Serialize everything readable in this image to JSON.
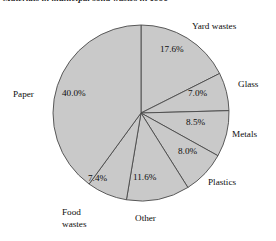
{
  "chart_data": {
    "type": "pie",
    "title": "Materials in municipal solid wastes in 1990",
    "xlabel": "",
    "ylabel": "",
    "legend": "none",
    "grid": false,
    "categories": [
      "Yard wastes",
      "Glass",
      "Metals",
      "Plastics",
      "Other",
      "Food wastes",
      "Paper"
    ],
    "values": [
      17.6,
      7.0,
      8.5,
      8.0,
      11.6,
      7.4,
      40.0
    ],
    "value_labels": [
      "17.6%",
      "7.0%",
      "8.5%",
      "8.0%",
      "11.6%",
      "7.4%",
      "40.0%"
    ],
    "units": "percent",
    "start_angle_deg": 0,
    "direction": "clockwise",
    "slice_fill": "#c9c9c9",
    "slice_stroke": "#4a4a4a",
    "slices": [
      {
        "name": "Yard wastes",
        "value": 17.6,
        "label": "17.6%"
      },
      {
        "name": "Glass",
        "value": 7.0,
        "label": "7.0%"
      },
      {
        "name": "Metals",
        "value": 8.5,
        "label": "8.5%"
      },
      {
        "name": "Plastics",
        "value": 8.0,
        "label": "8.0%"
      },
      {
        "name": "Other",
        "value": 11.6,
        "label": "11.6%"
      },
      {
        "name": "Food wastes",
        "value": 7.4,
        "label": "7.4%"
      },
      {
        "name": "Paper",
        "value": 40.0,
        "label": "40.0%"
      }
    ]
  },
  "labels": {
    "yard_wastes": "Yard wastes",
    "glass": "Glass",
    "metals": "Metals",
    "plastics": "Plastics",
    "other": "Other",
    "food_wastes_line1": "Food",
    "food_wastes_line2": "wastes",
    "paper": "Paper"
  },
  "values": {
    "yard_wastes": "17.6%",
    "glass": "7.0%",
    "metals": "8.5%",
    "plastics": "8.0%",
    "other": "11.6%",
    "food_wastes": "7.4%",
    "paper": "40.0%"
  }
}
